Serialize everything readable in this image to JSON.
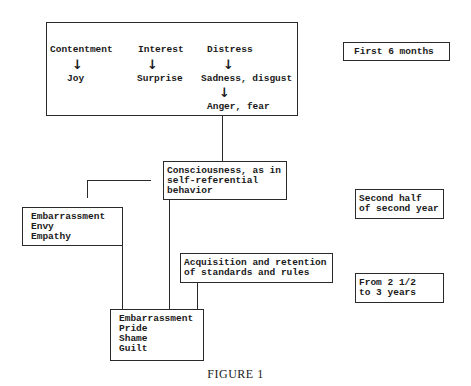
{
  "first_six_months": {
    "emotions": [
      {
        "primary": "Contentment",
        "derived": "Joy"
      },
      {
        "primary": "Interest",
        "derived": "Surprise"
      },
      {
        "primary": "Distress",
        "derived": "Sadness, disgust",
        "further": "Anger, fear"
      }
    ],
    "period_label": "First 6 months"
  },
  "consciousness": {
    "lines": [
      "Consciousness, as in",
      "self-referential",
      "behavior"
    ]
  },
  "exposed_emotions": {
    "lines": [
      "Embarrassment",
      "Envy",
      "Empathy"
    ]
  },
  "second_half": {
    "period_lines": [
      "Second half",
      "of second year"
    ]
  },
  "standards": {
    "lines": [
      "Acquisition and retention",
      "of standards and rules"
    ]
  },
  "evaluative_emotions": {
    "lines": [
      "Embarrassment",
      "Pride",
      "Shame",
      "Guilt"
    ]
  },
  "third_period": {
    "period_lines": [
      "From 2 1/2",
      "to 3 years"
    ]
  },
  "icons": {
    "arrow": "↓"
  },
  "caption": "FIGURE 1"
}
